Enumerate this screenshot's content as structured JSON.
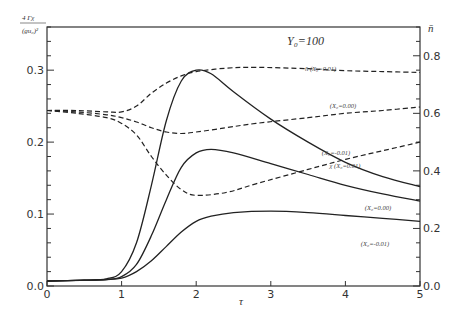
{
  "chart_data": {
    "type": "line",
    "title": "",
    "annotation_title": "Y₀=100",
    "xlabel": "τ",
    "ylabel_left": "4Γχ / (gu₀)²",
    "ylabel_left_num": "4 Γχ",
    "ylabel_left_den": "(gu₀)²",
    "ylabel_right": "n̄",
    "xlim": [
      0,
      5
    ],
    "ylim_left": [
      0,
      0.36
    ],
    "ylim_right": [
      0,
      0.9
    ],
    "xticks": [
      0,
      1,
      2,
      3,
      4,
      5
    ],
    "xtick_labels": [
      "0",
      "1",
      "2",
      "3",
      "4",
      "5"
    ],
    "yticks_left": [
      0.0,
      0.1,
      0.2,
      0.3
    ],
    "ytick_labels_left": [
      "0.0",
      "0.1",
      "0.2",
      "0.3"
    ],
    "yticks_right": [
      0.0,
      0.2,
      0.4,
      0.6,
      0.8
    ],
    "ytick_labels_right": [
      "0.0",
      "0.2",
      "0.4",
      "0.6",
      "0.8"
    ],
    "grid": false,
    "legend": "inline-annotations",
    "series": [
      {
        "name": "χ (X₀=0.01)",
        "label": "χ (X₀=0.01)",
        "axis": "left",
        "style": "solid",
        "x": [
          0,
          0.5,
          0.8,
          1.0,
          1.2,
          1.4,
          1.6,
          1.8,
          2.0,
          2.2,
          2.5,
          3.0,
          3.5,
          4.0,
          4.5,
          5.0
        ],
        "y": [
          0.007,
          0.008,
          0.01,
          0.02,
          0.06,
          0.14,
          0.23,
          0.285,
          0.3,
          0.295,
          0.27,
          0.232,
          0.2,
          0.172,
          0.152,
          0.138
        ]
      },
      {
        "name": "χ (X₀=0.00)",
        "label": "(X₀=0.00)",
        "axis": "left",
        "style": "solid",
        "x": [
          0,
          0.5,
          0.8,
          1.0,
          1.2,
          1.4,
          1.6,
          1.8,
          2.0,
          2.2,
          2.5,
          3.0,
          3.5,
          4.0,
          4.5,
          5.0
        ],
        "y": [
          0.007,
          0.008,
          0.009,
          0.013,
          0.03,
          0.07,
          0.12,
          0.165,
          0.185,
          0.19,
          0.185,
          0.17,
          0.155,
          0.14,
          0.128,
          0.118
        ]
      },
      {
        "name": "χ (X₀=-0.01)",
        "label": "(X₀=-0.01)",
        "axis": "left",
        "style": "solid",
        "x": [
          0,
          0.5,
          0.8,
          1.0,
          1.2,
          1.4,
          1.6,
          1.8,
          2.0,
          2.2,
          2.5,
          3.0,
          3.5,
          4.0,
          4.5,
          5.0
        ],
        "y": [
          0.007,
          0.008,
          0.009,
          0.011,
          0.02,
          0.035,
          0.055,
          0.075,
          0.09,
          0.097,
          0.102,
          0.104,
          0.102,
          0.098,
          0.094,
          0.09
        ]
      },
      {
        "name": "n̄ (X₀=0.01)",
        "label": "n̄  (X₀=0.01)",
        "axis": "right",
        "style": "dashed",
        "x": [
          0,
          0.4,
          0.8,
          1.0,
          1.2,
          1.4,
          1.6,
          1.8,
          2.0,
          2.4,
          2.8,
          3.5,
          4.0,
          4.5,
          5.0
        ],
        "y": [
          0.61,
          0.61,
          0.605,
          0.605,
          0.625,
          0.67,
          0.705,
          0.73,
          0.745,
          0.757,
          0.76,
          0.755,
          0.748,
          0.745,
          0.742
        ]
      },
      {
        "name": "n̄ (X₀=0.00)",
        "label": "(X₀=0.00)",
        "axis": "right",
        "style": "dashed",
        "x": [
          0,
          0.4,
          0.8,
          1.0,
          1.2,
          1.4,
          1.6,
          1.8,
          2.0,
          2.4,
          2.8,
          3.5,
          4.0,
          4.5,
          5.0
        ],
        "y": [
          0.61,
          0.605,
          0.595,
          0.585,
          0.57,
          0.55,
          0.535,
          0.53,
          0.535,
          0.55,
          0.565,
          0.585,
          0.6,
          0.61,
          0.622
        ]
      },
      {
        "name": "n̄ (X₀=-0.01)",
        "label": "(X₀=-0.01)",
        "axis": "right",
        "style": "dashed",
        "x": [
          0,
          0.4,
          0.8,
          1.0,
          1.2,
          1.4,
          1.6,
          1.8,
          2.0,
          2.4,
          2.8,
          3.5,
          4.0,
          4.5,
          5.0
        ],
        "y": [
          0.61,
          0.6,
          0.585,
          0.565,
          0.525,
          0.45,
          0.385,
          0.335,
          0.315,
          0.325,
          0.355,
          0.405,
          0.44,
          0.47,
          0.5
        ]
      }
    ]
  }
}
